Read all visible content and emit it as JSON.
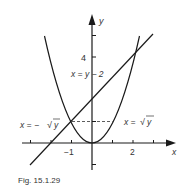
{
  "figure": {
    "caption": "Fig. 15.1.29",
    "axes": {
      "x_label": "x",
      "y_label": "y",
      "x_ticks": [
        -3,
        -2,
        -1,
        0,
        1,
        2,
        3
      ],
      "x_tick_labels": {
        "neg1": "−1",
        "two": "2"
      },
      "y_ticks": [
        -1,
        1,
        2,
        3,
        4,
        5
      ],
      "y_tick_labels": {
        "four": "4"
      }
    },
    "curves": {
      "parabola": {
        "equation": "y = x²"
      },
      "line": {
        "equation": "y = x + 2"
      }
    },
    "annotations": {
      "line_label": "x = y − 2",
      "left_branch_label": "x = −√y",
      "right_branch_label": "x = √y",
      "left_prefix": "x = −",
      "right_prefix": "x = ",
      "sqrt_var": "y"
    },
    "colors": {
      "ink": "#1a1a1a",
      "text": "#333333",
      "background": "#ffffff"
    }
  }
}
